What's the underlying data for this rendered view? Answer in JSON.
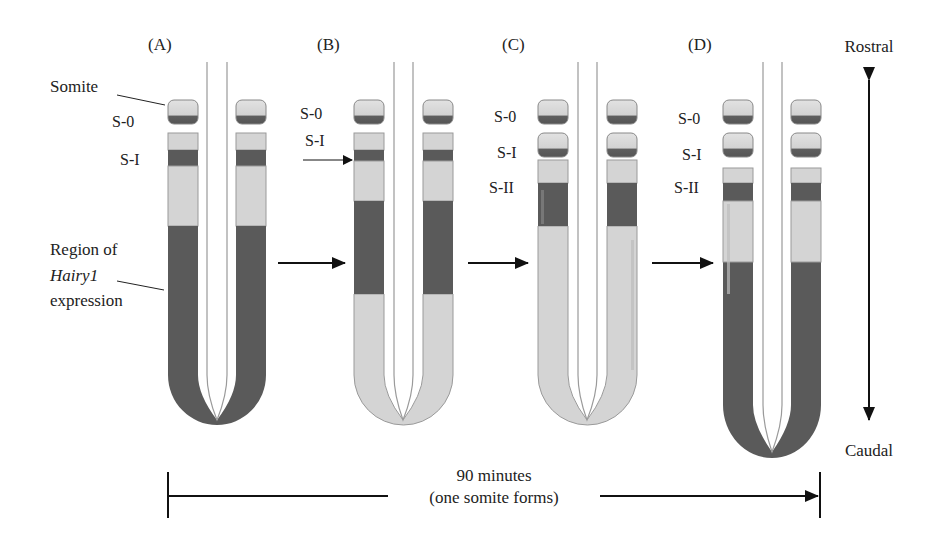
{
  "figure": {
    "panels": [
      {
        "id": "A",
        "label": "(A)",
        "somite_labels": [
          "S-0",
          "S-I"
        ]
      },
      {
        "id": "B",
        "label": "(B)",
        "somite_labels": [
          "S-0",
          "S-I"
        ]
      },
      {
        "id": "C",
        "label": "(C)",
        "somite_labels": [
          "S-0",
          "S-I",
          "S-II"
        ]
      },
      {
        "id": "D",
        "label": "(D)",
        "somite_labels": [
          "S-0",
          "S-I",
          "S-II"
        ]
      }
    ],
    "callouts": {
      "somite": "Somite",
      "region_line1": "Region of",
      "region_line2": "Hairy1",
      "region_line3": "expression"
    },
    "axis": {
      "top": "Rostral",
      "bottom": "Caudal"
    },
    "timeline": {
      "line1": "90 minutes",
      "line2": "(one somite forms)"
    },
    "colors": {
      "dark": "#5a5a5a",
      "light": "#d4d4d4",
      "outline": "#9a9a9a",
      "line": "#111111"
    }
  }
}
